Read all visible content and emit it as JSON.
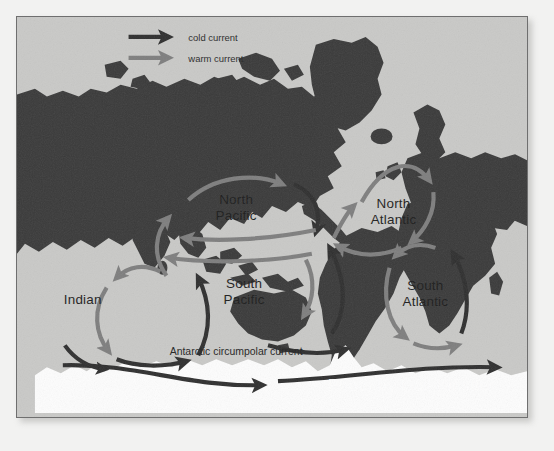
{
  "figure": {
    "type": "ocean-currents-map",
    "watermark": "Photo by Gail Kinstler"
  },
  "legend": {
    "items": [
      {
        "label": "cold current",
        "color": "#2f2f2f",
        "icon": "arrow-right-icon"
      },
      {
        "label": "warm current",
        "color": "#7e7e7e",
        "icon": "arrow-right-icon"
      }
    ]
  },
  "colors": {
    "ocean": "#c9c9c7",
    "land": "#3a3a3a",
    "ice": "#fdfdfd",
    "cold_current": "#2f2f2f",
    "warm_current": "#7e7e7e",
    "frame": "#6f6f6f",
    "paper": "#f2f2f1"
  },
  "gyres": [
    {
      "name": "North Pacific",
      "label": "North\nPacific",
      "line1": "North",
      "line2": "Pacific",
      "rotation": "clockwise"
    },
    {
      "name": "North Atlantic",
      "label": "North\nAtlantic",
      "line1": "North",
      "line2": "Atlantic",
      "rotation": "clockwise"
    },
    {
      "name": "South Pacific",
      "label": "South\nPacific",
      "line1": "South",
      "line2": "Pacific",
      "rotation": "counterclockwise"
    },
    {
      "name": "South Atlantic",
      "label": "South\nAtlantic",
      "line1": "South",
      "line2": "Atlantic",
      "rotation": "counterclockwise"
    },
    {
      "name": "Indian",
      "label": "Indian",
      "line1": "Indian",
      "line2": "",
      "rotation": "counterclockwise"
    }
  ],
  "currents": {
    "circumpolar_label": "Antarctic circumpolar current"
  }
}
